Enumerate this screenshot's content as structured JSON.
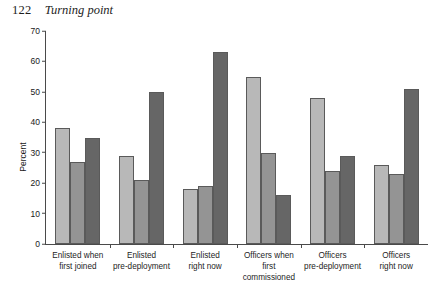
{
  "page": {
    "folio": "122",
    "running_head": "Turning point"
  },
  "chart_data": {
    "type": "bar",
    "title": "",
    "xlabel": "",
    "ylabel": "Percent",
    "ylim": [
      0,
      70
    ],
    "yticks": [
      0,
      10,
      20,
      30,
      40,
      50,
      60,
      70
    ],
    "grid": false,
    "legend": "none",
    "categories": [
      "Enlisted when first joined",
      "Enlisted pre-deployment",
      "Enlisted right now",
      "Officers when first commissioned",
      "Officers pre-deployment",
      "Officers right now"
    ],
    "category_lines": [
      [
        "Enlisted when",
        "first joined"
      ],
      [
        "Enlisted",
        "pre-deployment"
      ],
      [
        "Enlisted",
        "right now"
      ],
      [
        "Officers when first",
        "commissioned"
      ],
      [
        "Officers",
        "pre-deployment"
      ],
      [
        "Officers",
        "right now"
      ]
    ],
    "series": [
      {
        "name": "light",
        "color": "#b8b8b8",
        "values": [
          38,
          29,
          18,
          55,
          48,
          26
        ]
      },
      {
        "name": "medium",
        "color": "#949494",
        "values": [
          27,
          21,
          19,
          30,
          24,
          23
        ]
      },
      {
        "name": "dark",
        "color": "#666666",
        "values": [
          35,
          50,
          63,
          16,
          29,
          51
        ]
      }
    ]
  }
}
